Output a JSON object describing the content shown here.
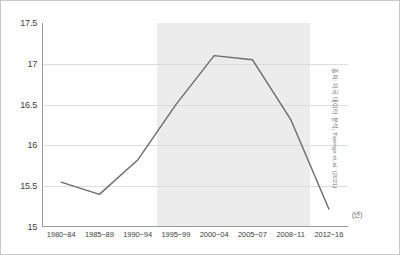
{
  "chart_data": {
    "type": "line",
    "title": "",
    "subtitle": "",
    "xlabel": "(년)",
    "ylabel": "",
    "categories": [
      "1980~84",
      "1985~89",
      "1990~94",
      "1995~99",
      "2000~04",
      "2005~07",
      "2008~11",
      "2012~16"
    ],
    "values": [
      15.55,
      15.4,
      15.82,
      16.5,
      17.1,
      17.05,
      16.32,
      15.22
    ],
    "series": [
      {
        "name": "",
        "values": [
          15.55,
          15.4,
          15.82,
          16.5,
          17.1,
          17.05,
          16.32,
          15.22
        ]
      }
    ],
    "ylim": [
      15,
      17.5
    ],
    "yticks": [
      "15",
      "15.5",
      "16",
      "16.5",
      "17",
      "17.5"
    ],
    "ytick_values": [
      15,
      15.5,
      16,
      16.5,
      17,
      17.5
    ],
    "grid": true,
    "legend": false,
    "legend_position": "none",
    "highlight_band": {
      "start_category": "1995~99",
      "end_category": "2008~11",
      "color": "#ececec"
    },
    "line_color": "#6b6b6b",
    "annotations": []
  },
  "axis": {
    "x_unit_label": "(년)"
  },
  "source": {
    "note": "출처: 미국 데이터 분석, Twenge et al. (2021)"
  }
}
